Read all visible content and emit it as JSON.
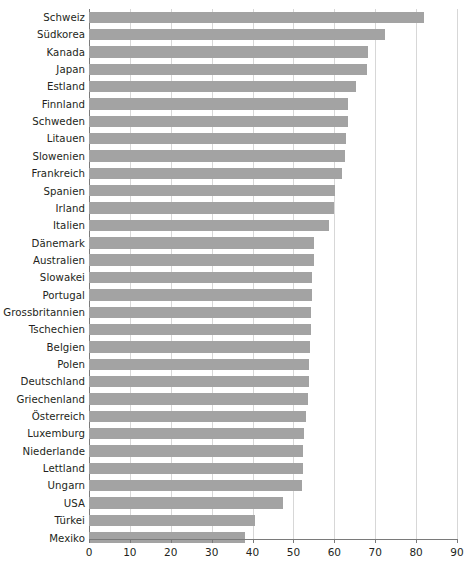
{
  "chart_data": {
    "type": "bar",
    "orientation": "horizontal",
    "title": "",
    "subtitle": "",
    "xlabel": "",
    "ylabel": "",
    "xlim": [
      0,
      90
    ],
    "xticks": [
      0,
      10,
      20,
      30,
      40,
      50,
      60,
      70,
      80,
      90
    ],
    "xtick_labels": [
      "0",
      "10",
      "20",
      "30",
      "40",
      "50",
      "60",
      "70",
      "80",
      "90"
    ],
    "grid": "vertical",
    "legend": "none",
    "bar_color": "#a3a3a3",
    "gridline_color": "#d7d7d7",
    "axis_color": "#7a7a7a",
    "text_color": "#231f20",
    "categories": [
      "Schweiz",
      "Südkorea",
      "Kanada",
      "Japan",
      "Estland",
      "Finnland",
      "Schweden",
      "Litauen",
      "Slowenien",
      "Frankreich",
      "Spanien",
      "Irland",
      "Italien",
      "Dänemark",
      "Australien",
      "Slowakei",
      "Portugal",
      "Grossbritannien",
      "Tschechien",
      "Belgien",
      "Polen",
      "Deutschland",
      "Griechenland",
      "Österreich",
      "Luxemburg",
      "Niederlande",
      "Lettland",
      "Ungarn",
      "USA",
      "Türkei",
      "Mexiko"
    ],
    "values": [
      82.0,
      72.4,
      68.2,
      68.0,
      65.3,
      63.4,
      63.3,
      62.9,
      62.7,
      61.8,
      60.2,
      59.8,
      58.6,
      55.0,
      55.0,
      54.6,
      54.5,
      54.3,
      54.2,
      54.0,
      53.9,
      53.8,
      53.6,
      53.0,
      52.5,
      52.4,
      52.3,
      52.0,
      47.5,
      40.7,
      38.2
    ]
  }
}
